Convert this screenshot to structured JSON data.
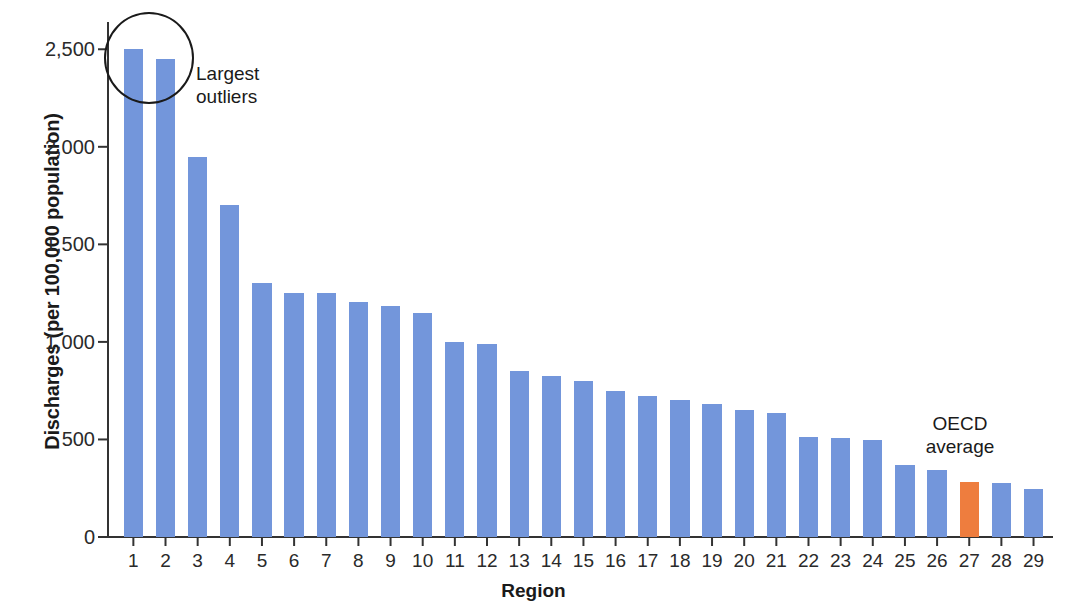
{
  "chart_data": {
    "type": "bar",
    "title": "",
    "xlabel": "Region",
    "ylabel": "Discharges (per 100,000 population)",
    "categories": [
      "1",
      "2",
      "3",
      "4",
      "5",
      "6",
      "7",
      "8",
      "9",
      "10",
      "11",
      "12",
      "13",
      "14",
      "15",
      "16",
      "17",
      "18",
      "19",
      "20",
      "21",
      "22",
      "23",
      "24",
      "25",
      "26",
      "27",
      "28",
      "29"
    ],
    "values": [
      2500,
      2450,
      1950,
      1700,
      1300,
      1250,
      1250,
      1205,
      1185,
      1150,
      1000,
      990,
      850,
      825,
      800,
      750,
      725,
      700,
      680,
      650,
      635,
      515,
      510,
      495,
      370,
      345,
      280,
      275,
      245
    ],
    "ylim": [
      0,
      2650
    ],
    "yticks": [
      0,
      500,
      1000,
      1500,
      2000,
      2500
    ],
    "ytick_labels": [
      "0",
      "500",
      "1,000",
      "1,500",
      "2,000",
      "2,500"
    ],
    "grid": false,
    "legend": "none",
    "bar_color": "#7396db",
    "highlight_color": "#ee7d3e",
    "highlight_index": 26,
    "annotations": [
      {
        "id": "largest-outliers",
        "text": "Largest\noutliers",
        "targets": [
          1,
          2
        ],
        "marker": "circle"
      },
      {
        "id": "oecd-average",
        "text": "OECD\naverage",
        "targets": [
          27
        ],
        "marker": "none"
      }
    ]
  },
  "axis": {
    "x_title": "Region",
    "y_title": "Discharges (per 100,000 population)"
  },
  "annotations": {
    "outliers_line1": "Largest",
    "outliers_line2": "outliers",
    "oecd_line1": "OECD",
    "oecd_line2": "average"
  }
}
